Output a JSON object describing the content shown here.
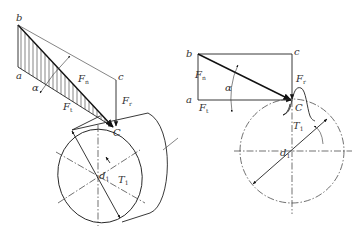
{
  "diagram": {
    "type": "gear force analysis",
    "left_figure": {
      "points": {
        "b": "b",
        "a": "a",
        "c": "c",
        "C": "C"
      },
      "forces": {
        "normal": {
          "base": "F",
          "sub": "n"
        },
        "tangential": {
          "base": "F",
          "sub": "t"
        },
        "radial": {
          "base": "F",
          "sub": "r"
        }
      },
      "angle": "α",
      "torque": {
        "base": "T",
        "sub": "1"
      },
      "diameter": {
        "base": "d",
        "sub": "1"
      }
    },
    "right_figure": {
      "points": {
        "b": "b",
        "a": "a",
        "c": "c",
        "C": "C"
      },
      "forces": {
        "normal": {
          "base": "F",
          "sub": "n"
        },
        "tangential": {
          "base": "F",
          "sub": "t"
        },
        "radial": {
          "base": "F",
          "sub": "r"
        }
      },
      "angle": "α",
      "torque": {
        "base": "T",
        "sub": "1"
      },
      "diameter": {
        "base": "d",
        "sub": "1"
      }
    }
  }
}
